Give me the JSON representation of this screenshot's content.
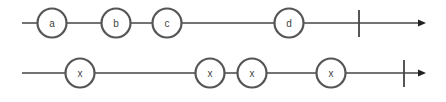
{
  "diagram": {
    "type": "marble-diagram",
    "colors": {
      "background": "#ffffff",
      "line": "#444444",
      "marble_stroke": "#555555",
      "marble_fill": "#ffffff",
      "text": "#444444"
    },
    "streams": [
      {
        "name": "source",
        "y": 23,
        "x_start": 22,
        "x_end": 425,
        "completion_x": 359,
        "marbles": [
          {
            "label": "a",
            "x": 52
          },
          {
            "label": "b",
            "x": 116
          },
          {
            "label": "c",
            "x": 167
          },
          {
            "label": "d",
            "x": 289
          }
        ]
      },
      {
        "name": "result",
        "y": 73,
        "x_start": 22,
        "x_end": 425,
        "completion_x": 404,
        "marbles": [
          {
            "label": "x",
            "x": 80
          },
          {
            "label": "x",
            "x": 210
          },
          {
            "label": "x",
            "x": 252
          },
          {
            "label": "x",
            "x": 331
          }
        ]
      }
    ]
  }
}
